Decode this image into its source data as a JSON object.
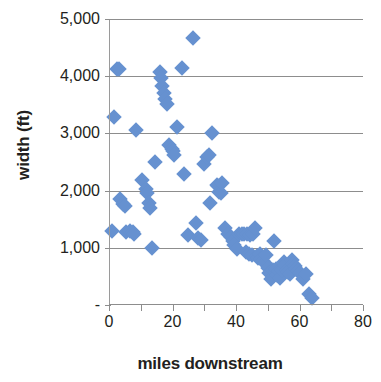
{
  "chart_data": {
    "type": "scatter",
    "title": "",
    "xlabel": "miles downstream",
    "ylabel": "width (ft)",
    "xlim": [
      0,
      80
    ],
    "ylim": [
      0,
      5000
    ],
    "x_ticks": [
      "0",
      "20",
      "40",
      "60",
      "80"
    ],
    "x_tick_values": [
      0,
      20,
      40,
      60,
      80
    ],
    "x_minor_tick_values": [
      10,
      30,
      50,
      70
    ],
    "y_ticks": [
      "-",
      "1,000",
      "2,000",
      "3,000",
      "4,000",
      "5,000"
    ],
    "y_tick_values": [
      0,
      1000,
      2000,
      3000,
      4000,
      5000
    ],
    "grid": "horizontal",
    "legend": "none",
    "marker": {
      "shape": "diamond",
      "color": "#6691d0",
      "size": 11
    },
    "series": [
      {
        "name": "river width",
        "points": [
          [
            1.0,
            1300
          ],
          [
            1.5,
            3280
          ],
          [
            2.5,
            4120
          ],
          [
            3.0,
            4130
          ],
          [
            3.5,
            1860
          ],
          [
            4.5,
            1770
          ],
          [
            5.0,
            1730
          ],
          [
            5.5,
            1280
          ],
          [
            6.5,
            1300
          ],
          [
            7.5,
            1280
          ],
          [
            8.0,
            1250
          ],
          [
            8.5,
            3060
          ],
          [
            10.5,
            2180
          ],
          [
            11.5,
            2030
          ],
          [
            12.0,
            1960
          ],
          [
            12.5,
            1790
          ],
          [
            12.8,
            1700
          ],
          [
            13.5,
            1000
          ],
          [
            14.5,
            2500
          ],
          [
            16.0,
            4080
          ],
          [
            16.3,
            3970
          ],
          [
            16.8,
            3830
          ],
          [
            17.2,
            3700
          ],
          [
            17.6,
            3600
          ],
          [
            18.2,
            3520
          ],
          [
            19.0,
            2800
          ],
          [
            19.8,
            2720
          ],
          [
            20.2,
            2700
          ],
          [
            20.6,
            2630
          ],
          [
            21.5,
            3110
          ],
          [
            23.0,
            4140
          ],
          [
            23.5,
            2290
          ],
          [
            25.0,
            1220
          ],
          [
            26.5,
            4670
          ],
          [
            27.5,
            1440
          ],
          [
            28.0,
            1170
          ],
          [
            29.0,
            1140
          ],
          [
            30.0,
            2470
          ],
          [
            31.0,
            2580
          ],
          [
            31.5,
            2620
          ],
          [
            31.8,
            1790
          ],
          [
            32.5,
            3000
          ],
          [
            34.0,
            2100
          ],
          [
            34.4,
            2080
          ],
          [
            34.8,
            1970
          ],
          [
            35.2,
            1950
          ],
          [
            35.6,
            2140
          ],
          [
            36.5,
            1350
          ],
          [
            37.5,
            1250
          ],
          [
            38.5,
            1190
          ],
          [
            39.0,
            1120
          ],
          [
            39.5,
            1050
          ],
          [
            40.2,
            980
          ],
          [
            41.0,
            1240
          ],
          [
            41.8,
            1250
          ],
          [
            42.5,
            1240
          ],
          [
            43.0,
            930
          ],
          [
            43.5,
            1250
          ],
          [
            44.0,
            900
          ],
          [
            44.5,
            1230
          ],
          [
            45.0,
            880
          ],
          [
            45.5,
            1250
          ],
          [
            46.0,
            1340
          ],
          [
            46.5,
            850
          ],
          [
            47.0,
            830
          ],
          [
            47.5,
            900
          ],
          [
            48.0,
            800
          ],
          [
            48.5,
            770
          ],
          [
            49.0,
            740
          ],
          [
            49.5,
            870
          ],
          [
            50.0,
            640
          ],
          [
            50.5,
            560
          ],
          [
            51.0,
            450
          ],
          [
            51.5,
            620
          ],
          [
            52.0,
            1120
          ],
          [
            52.5,
            630
          ],
          [
            53.0,
            520
          ],
          [
            53.5,
            600
          ],
          [
            54.0,
            480
          ],
          [
            54.5,
            620
          ],
          [
            55.0,
            760
          ],
          [
            55.5,
            700
          ],
          [
            56.0,
            620
          ],
          [
            56.5,
            580
          ],
          [
            57.0,
            540
          ],
          [
            57.5,
            780
          ],
          [
            58.0,
            720
          ],
          [
            58.5,
            680
          ],
          [
            59.0,
            630
          ],
          [
            59.5,
            600
          ],
          [
            60.0,
            560
          ],
          [
            61.0,
            450
          ],
          [
            62.0,
            540
          ],
          [
            63.0,
            200
          ],
          [
            64.0,
            130
          ]
        ]
      }
    ]
  }
}
